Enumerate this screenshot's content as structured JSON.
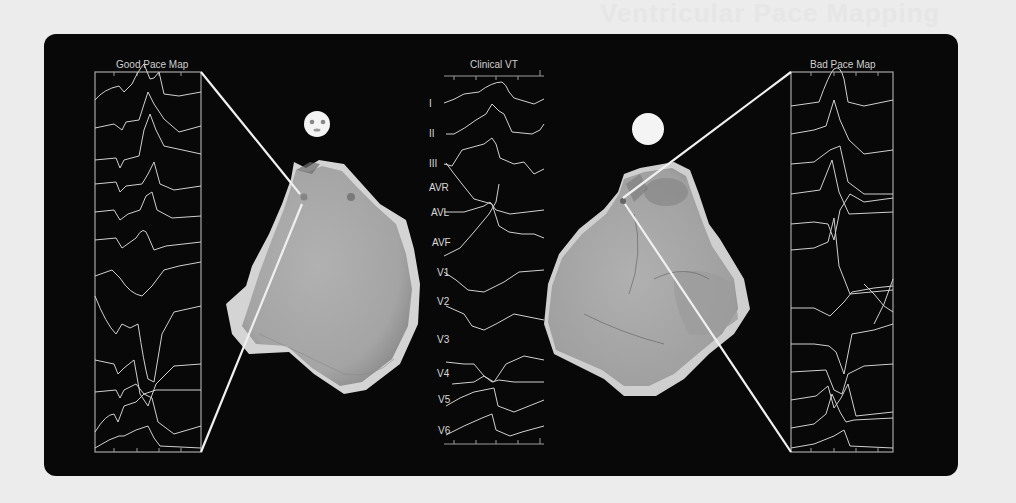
{
  "header": {
    "faint_title": "Ventricular Pace Mapping"
  },
  "panels": {
    "good_pace_map": {
      "title": "Good Pace Map",
      "indicator": "smiley-face"
    },
    "clinical_vt": {
      "title": "Clinical VT",
      "leads": [
        "I",
        "II",
        "III",
        "AVR",
        "AVL",
        "AVF",
        "V1",
        "V2",
        "V3",
        "V4",
        "V5",
        "V6"
      ]
    },
    "bad_pace_map": {
      "title": "Bad Pace Map",
      "indicator": "blank-face"
    }
  },
  "colors": {
    "background": "#080808",
    "trace": "#d0d0d0",
    "frame": "#9a9a9a",
    "heart": "#a9a9a9",
    "page": "#ececec"
  }
}
